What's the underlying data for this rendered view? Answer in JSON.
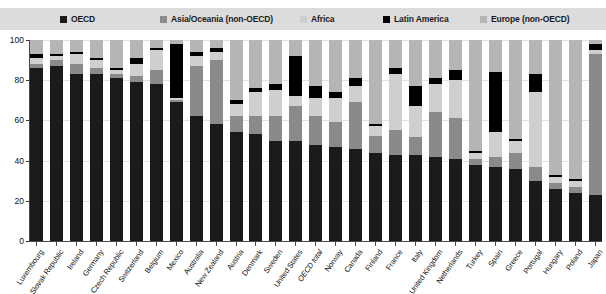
{
  "legend": {
    "items": [
      {
        "label": "OECD",
        "color": "#1a1a1a",
        "left": 60
      },
      {
        "label": "Asia/Oceania (non-OECD)",
        "color": "#8a8a8a",
        "left": 160
      },
      {
        "label": "Africa",
        "color": "#cfcfcf",
        "left": 300
      },
      {
        "label": "Latin America",
        "color": "#000000",
        "left": 383
      },
      {
        "label": "Europe (non-OECD)",
        "color": "#b5b5b5",
        "left": 480
      }
    ]
  },
  "axes": {
    "y_ticks": [
      0,
      20,
      40,
      60,
      80,
      100
    ],
    "ylim": [
      0,
      100
    ]
  },
  "chart_data": {
    "type": "bar",
    "stacked": true,
    "normalized_percent": true,
    "title": "",
    "subtitle": "",
    "xlabel": "",
    "ylabel": "",
    "ylim": [
      0,
      100
    ],
    "yticks": [
      0,
      20,
      40,
      60,
      80,
      100
    ],
    "grid": true,
    "legend_position": "top",
    "series_order": [
      "OECD",
      "Asia/Oceania (non-OECD)",
      "Africa",
      "Latin America",
      "Europe (non-OECD)"
    ],
    "colors": {
      "OECD": "#1a1a1a",
      "Asia/Oceania (non-OECD)": "#8a8a8a",
      "Africa": "#cfcfcf",
      "Latin America": "#000000",
      "Europe (non-OECD)": "#b5b5b5"
    },
    "categories": [
      "Luxembourg",
      "Slovak Republic",
      "Ireland",
      "Germany",
      "Czech Republic",
      "Switzerland",
      "Belgium",
      "Mexico",
      "Australia",
      "New Zealand",
      "Austria",
      "Denmark",
      "Sweden",
      "United States",
      "OECD total",
      "Norway",
      "Canada",
      "Finland",
      "France",
      "Italy",
      "United Kingdom",
      "Netherlands",
      "Turkey",
      "Spain",
      "Greece",
      "Portugal",
      "Hungary",
      "Poland",
      "Japan"
    ],
    "category_styles": {
      "OECD total": "italic"
    },
    "series": [
      {
        "name": "OECD",
        "values": [
          86,
          87,
          83,
          83,
          81,
          79,
          78,
          69,
          62,
          58,
          54,
          53,
          50,
          50,
          48,
          47,
          46,
          44,
          43,
          43,
          42,
          41,
          38,
          37,
          36,
          30,
          26,
          24,
          23
        ]
      },
      {
        "name": "Asia/Oceania (non-OECD)",
        "values": [
          2,
          3,
          5,
          3,
          2,
          3,
          7,
          1,
          25,
          32,
          8,
          9,
          12,
          17,
          14,
          12,
          23,
          8,
          12,
          9,
          22,
          20,
          3,
          5,
          8,
          7,
          3,
          3,
          70
        ]
      },
      {
        "name": "Africa",
        "values": [
          3,
          2,
          5,
          4,
          2,
          6,
          10,
          1,
          5,
          4,
          6,
          12,
          13,
          5,
          9,
          12,
          8,
          5,
          28,
          15,
          14,
          19,
          3,
          12,
          6,
          37,
          3,
          3,
          2
        ]
      },
      {
        "name": "Latin America",
        "values": [
          2,
          1,
          1,
          1,
          1,
          3,
          1,
          27,
          2,
          2,
          2,
          2,
          3,
          20,
          6,
          3,
          4,
          1,
          3,
          10,
          3,
          5,
          1,
          30,
          1,
          9,
          1,
          1,
          3
        ]
      },
      {
        "name": "Europe (non-OECD)",
        "values": [
          7,
          7,
          6,
          9,
          14,
          9,
          4,
          2,
          6,
          4,
          30,
          24,
          22,
          8,
          23,
          26,
          19,
          42,
          14,
          23,
          19,
          15,
          55,
          16,
          49,
          17,
          67,
          69,
          2
        ]
      }
    ]
  }
}
